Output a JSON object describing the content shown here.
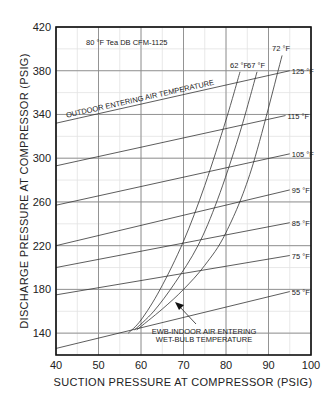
{
  "chart_data": {
    "type": "line",
    "title": "80 °F Tea DB CFM-1125",
    "xlabel": "SUCTION PRESSURE AT COMPRESSOR (PSIG)",
    "ylabel": "DISCHARGE PRESSURE AT COMPRESSOR (PSIG)",
    "xlim": [
      40,
      100
    ],
    "ylim": [
      120,
      420
    ],
    "x_ticks": [
      40,
      50,
      60,
      70,
      80,
      90,
      100
    ],
    "y_ticks": [
      140,
      180,
      220,
      260,
      300,
      340,
      380,
      420
    ],
    "grid": true,
    "outdoor_series_label": "OUTDOOR ENTERING AIR TEMPERATURE",
    "ewb_annotation": [
      "EWB-INDOOR AIR ENTERING",
      "WET-BULB TEMPERATURE"
    ],
    "outdoor_series": [
      {
        "name": "125 °F",
        "x": [
          40,
          95
        ],
        "y": [
          332,
          380
        ]
      },
      {
        "name": "115 °F",
        "x": [
          40,
          94
        ],
        "y": [
          293,
          339
        ]
      },
      {
        "name": "105 °F",
        "x": [
          40,
          95
        ],
        "y": [
          257,
          304
        ]
      },
      {
        "name": "95 °F",
        "x": [
          40,
          95
        ],
        "y": [
          220,
          271
        ]
      },
      {
        "name": "85 °F",
        "x": [
          40,
          95
        ],
        "y": [
          200,
          241
        ]
      },
      {
        "name": "75 °F",
        "x": [
          40,
          95
        ],
        "y": [
          175,
          211
        ]
      },
      {
        "name": "55 °F",
        "x": [
          40,
          95
        ],
        "y": [
          126,
          178
        ]
      }
    ],
    "ewb_series": [
      {
        "name": "62 °F",
        "x": [
          57,
          60,
          64.5,
          70,
          75,
          80,
          83.3
        ],
        "y": [
          140,
          152,
          180,
          224,
          275,
          335,
          379
        ]
      },
      {
        "name": "67 °F",
        "x": [
          58.5,
          63,
          68,
          73.4,
          78,
          83,
          87.3
        ],
        "y": [
          143,
          160,
          186,
          220,
          262,
          320,
          379
        ]
      },
      {
        "name": "72 °F",
        "x": [
          59,
          65,
          70,
          75,
          80,
          86,
          93.2
        ],
        "y": [
          143,
          162,
          180,
          202,
          232,
          290,
          394
        ]
      }
    ]
  }
}
